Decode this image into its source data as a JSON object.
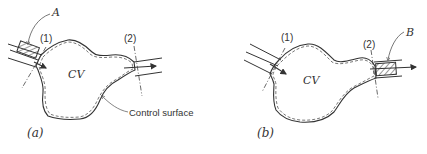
{
  "figure": {
    "panel_a": {
      "caption": "(a)",
      "cv_label": "CV",
      "section_1": "(1)",
      "section_2": "(2)",
      "callout": "A",
      "surface_label": "Control surface"
    },
    "panel_b": {
      "caption": "(b)",
      "cv_label": "CV",
      "section_1": "(1)",
      "section_2": "(2)",
      "callout": "B"
    },
    "colors": {
      "line": "#333333",
      "background": "#ffffff"
    }
  }
}
